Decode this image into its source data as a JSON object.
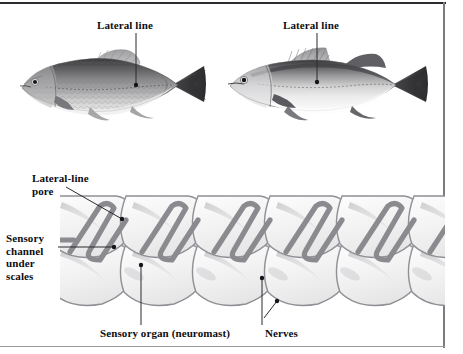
{
  "figure": {
    "background_color": "#ffffff",
    "border_color_top": "#2b2b2f",
    "border_color_side": "#7b7b80",
    "width": 463,
    "height": 354
  },
  "upper_panel": {
    "name": "two-fish-illustrations",
    "fish": [
      {
        "id": "fish-minnow",
        "common_shape": "minnow-carp-body",
        "label": "Lateral line",
        "label_x": 97,
        "label_y": 19,
        "leader_dot_x": 136,
        "leader_dot_y": 85
      },
      {
        "id": "fish-perch",
        "common_shape": "perch-walleye-body",
        "label": "Lateral line",
        "label_x": 283,
        "label_y": 19,
        "leader_dot_x": 317,
        "leader_dot_y": 82
      }
    ]
  },
  "lower_panel": {
    "name": "lateral-line-scale-cutaway",
    "scale_rows": 2,
    "scales_per_row": 5,
    "channel_color": "#8a8a8f",
    "scale_fill": "#f4f4f4",
    "scale_outline": "#8f8f95",
    "shadow_color": "#d5d5d8",
    "labels": [
      {
        "id": "lateral-line-pore",
        "text": "Lateral-line\npore",
        "x": 32,
        "y": 172,
        "dot_x": 122,
        "dot_y": 219
      },
      {
        "id": "sensory-channel-under-scales",
        "text": "Sensory\nchannel\nunder\nscales",
        "x": 6,
        "y": 232,
        "dot_x": 114,
        "dot_y": 247
      },
      {
        "id": "sensory-organ-neuromast",
        "text": "Sensory organ (neuromast)",
        "x": 100,
        "y": 327,
        "dot_x": 141,
        "dot_y": 265
      },
      {
        "id": "nerves",
        "text": "Nerves",
        "x": 265,
        "y": 327,
        "dot_1_x": 262,
        "dot_1_y": 278,
        "dot_2_x": 277,
        "dot_2_y": 301
      }
    ]
  }
}
